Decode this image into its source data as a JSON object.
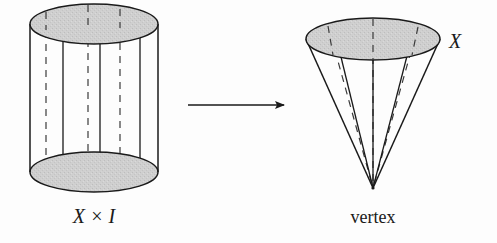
{
  "figure": {
    "kind": "mathematical-diagram",
    "background_color": "#fdfdfd",
    "ink_color": "#1a1a1a",
    "surface_fill_color": "#cccccc",
    "labels": {
      "cylinder": "X × I",
      "cone_top": "X",
      "cone_apex": "vertex"
    },
    "left_shape": {
      "name": "cylinder",
      "top_ellipse": {
        "cx": 94,
        "cy": 24,
        "rx": 64,
        "ry": 20
      },
      "bottom_ellipse": {
        "cx": 94,
        "cy": 172,
        "rx": 64,
        "ry": 20
      },
      "rulings_solid_x": [
        30,
        63,
        100,
        140,
        158
      ],
      "rulings_dashed_x": [
        46,
        88,
        120
      ]
    },
    "right_shape": {
      "name": "cone",
      "top_ellipse": {
        "cx": 373,
        "cy": 39,
        "rx": 67,
        "ry": 21
      },
      "apex": {
        "x": 373,
        "y": 188
      },
      "rulings_solid_deg": [
        180,
        214,
        256,
        300,
        0
      ],
      "rulings_dashed_deg": [
        196,
        270,
        325
      ]
    },
    "arrow": {
      "name": "maps-to-arrow",
      "x1": 188,
      "y1": 105,
      "x2": 285,
      "y2": 105
    }
  }
}
